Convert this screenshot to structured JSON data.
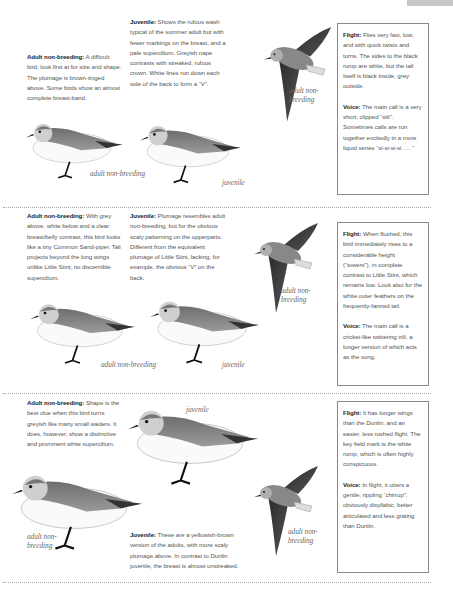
{
  "page": {
    "type": "field-guide-page"
  },
  "species": [
    {
      "id": "section-1",
      "adult": {
        "label": "Adult non-breeding:",
        "text": " A difficult bird; look first at for size and shape. The plumage is brown-tinged above. Some birds show an almost complete breast-band."
      },
      "juvenile": {
        "label": "Juvenile:",
        "text": " Shows the rufous wash typical of the summer adult but with fewer markings on the breast, and a pale supercilium. Greyish nape contrasts with streaked, rufous crown. White lines run down each side of the back to form a “V”."
      },
      "flight": {
        "label": "Flight:",
        "text": " Flies very fast, low, and with quick twists and turns. The sides to the black rump are white, but the tail itself is black inside, grey outside."
      },
      "voice": {
        "label": "Voice:",
        "text": " The main call is a very short, clipped “stit”. Sometimes calls are run together excitedly in a more liquid series “si-si-si-si …. ”"
      },
      "captions": {
        "flying": "adult non-breeding",
        "standing_adult": "adult non-breeding",
        "standing_juvenile": "juvenile"
      }
    },
    {
      "id": "section-2",
      "adult": {
        "label": "Adult non-breeding:",
        "text": " With grey above, white below and a clear breast/belly contrast, this bird looks like a tiny Common Sand-piper. Tail projects beyond the long wings unlike Little Stint; no discernible supercilium."
      },
      "juvenile": {
        "label": "Juvenile:",
        "text": " Plumage resembles adult non-breeding, but for the obvious scaly patterning on the upperparts. Different from the equivalent plumage of Little Stint, lacking, for example, the obvious “V” on the back."
      },
      "flight": {
        "label": "Flight:",
        "text": " When flushed, this bird immediately rises to a considerable height (“towers”), in complete contrast to Little Stint, which remains low. Look also for the white outer feathers on the frequently-fanned tail."
      },
      "voice": {
        "label": "Voice:",
        "text": " The main call is a cricket-like twittering trill, a longer version of which acts as the song."
      },
      "captions": {
        "flying": "adult non-breeding",
        "standing_adult": "adult non-breeding",
        "standing_juvenile": "juvenile"
      }
    },
    {
      "id": "section-3",
      "adult": {
        "label": "Adult non-breeding:",
        "text": " Shape is the best clue when this bird turns greyish like many small waders. It does, however, show a distinctive and prominent white supercilium."
      },
      "juvenile": {
        "label": "Juvenile:",
        "text": " These are a yellowish-brown version of the adults, with more scaly plumage above. In contrast to Dunlin juvenile, the breast is almost unstreaked."
      },
      "flight": {
        "label": "Flight:",
        "text": " It has longer wings than the Dunlin, and an easier, less rushed flight. The key field mark is the white rump, which is often highly conspicuous."
      },
      "voice": {
        "label": "Voice:",
        "text": " In flight, it utters a gentle, rippling “chirrup”, obviously disyllabic, better articulated and less grating than Dunlin."
      },
      "captions": {
        "flying": "adult non-breeding",
        "standing_adult": "adult non-breeding",
        "standing_juvenile": "juvenile"
      }
    }
  ]
}
